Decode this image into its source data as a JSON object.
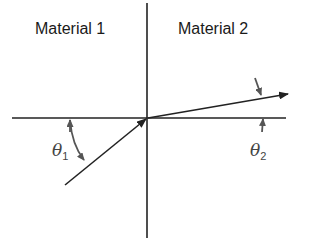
{
  "diagram": {
    "regions": [
      {
        "label": "Material 1"
      },
      {
        "label": "Material 2"
      }
    ],
    "angles": [
      {
        "symbol": "θ",
        "subscript": "1"
      },
      {
        "symbol": "θ",
        "subscript": "2"
      }
    ],
    "colors": {
      "line": "#222222",
      "annotation": "#555555"
    }
  }
}
